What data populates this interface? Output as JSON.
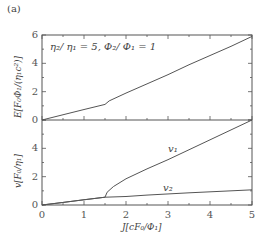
{
  "panel_label": "(a)",
  "annotation": "η₂/ η₁ = 5, Φ₂/ Φ₁ = 1",
  "curve_labels": {
    "v1": "v₁",
    "v2": "v₂"
  },
  "chart_data": [
    {
      "type": "line",
      "title": "",
      "xlabel": "J[cF₀/Φ₁]",
      "ylabel": "E[F₀Φ₁/(η₁c²)]",
      "xlim": [
        0,
        5
      ],
      "ylim": [
        0,
        6
      ],
      "xticks": [
        0,
        1,
        2,
        3,
        4,
        5
      ],
      "yticks": [
        0,
        2,
        4,
        6
      ],
      "grid": false,
      "annotation": "η₂/η₁ = 5, Φ₂/Φ₁ = 1",
      "series": [
        {
          "name": "E",
          "x": [
            0,
            0.5,
            1.0,
            1.5,
            1.6,
            2.0,
            2.5,
            3.0,
            3.5,
            4.0,
            4.5,
            5.0
          ],
          "y": [
            0,
            0.37,
            0.74,
            1.1,
            1.35,
            1.9,
            2.55,
            3.2,
            3.9,
            4.55,
            5.2,
            5.9
          ]
        }
      ]
    },
    {
      "type": "line",
      "title": "",
      "xlabel": "J[cF₀/Φ₁]",
      "ylabel": "v[F₀/η₁]",
      "xlim": [
        0,
        5
      ],
      "ylim": [
        0,
        6
      ],
      "xticks": [
        0,
        1,
        2,
        3,
        4,
        5
      ],
      "yticks": [
        0,
        2,
        4
      ],
      "grid": false,
      "series": [
        {
          "name": "v1",
          "x": [
            0,
            0.5,
            1.0,
            1.5,
            1.55,
            1.7,
            2.0,
            2.5,
            3.0,
            3.5,
            4.0,
            4.5,
            5.0
          ],
          "y": [
            0,
            0.18,
            0.37,
            0.55,
            0.9,
            1.3,
            1.85,
            2.55,
            3.2,
            3.9,
            4.6,
            5.3,
            6.0
          ]
        },
        {
          "name": "v2",
          "x": [
            0,
            0.5,
            1.0,
            1.5,
            2.0,
            2.5,
            3.0,
            3.5,
            4.0,
            4.5,
            5.0
          ],
          "y": [
            0,
            0.18,
            0.37,
            0.55,
            0.6,
            0.7,
            0.78,
            0.86,
            0.93,
            1.0,
            1.07
          ]
        }
      ]
    }
  ]
}
